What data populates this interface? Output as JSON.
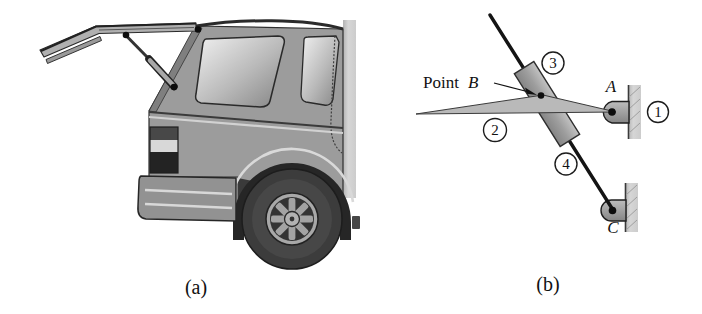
{
  "figure": {
    "background": "#ffffff",
    "panel_a": {
      "caption": "(a)",
      "subject": "suv-rear-open-liftgate-illustration"
    },
    "panel_b": {
      "caption": "(b)",
      "labels": {
        "point_prefix": "Point",
        "point_b": "B",
        "pin_a": "A",
        "pin_c": "C"
      },
      "links": {
        "ground": "1",
        "liftgate_arm": "2",
        "strut_cylinder": "3",
        "strut_rod": "4"
      }
    },
    "colors": {
      "line": "#1a1a1a",
      "body_gray": "#9c9c9c",
      "metal_mid": "#a6a6a6",
      "arm_gray": "#b9b9b9",
      "ground_strip": "#cfcfcf",
      "tire_dark": "#3a3a3a"
    }
  }
}
